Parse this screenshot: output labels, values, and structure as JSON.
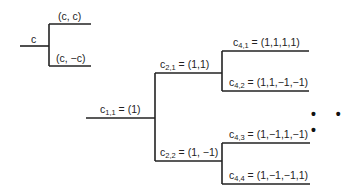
{
  "diagram": {
    "type": "code-tree",
    "left_tree": {
      "root_label": "c",
      "upper_label": "(c, c)",
      "lower_label": "(c, −c)"
    },
    "main_tree": {
      "root": {
        "base": "c",
        "sub": "1,1",
        "value": "= (1)"
      },
      "level2": [
        {
          "base": "c",
          "sub": "2,1",
          "value": "= (1,1)"
        },
        {
          "base": "c",
          "sub": "2,2",
          "value": "= (1, −1)"
        }
      ],
      "level4": [
        {
          "base": "c",
          "sub": "4,1",
          "value": "= (1,1,1,1)"
        },
        {
          "base": "c",
          "sub": "4,2",
          "value": "= (1,1,−1,−1)"
        },
        {
          "base": "c",
          "sub": "4,3",
          "value": "= (1,−1,1,−1)"
        },
        {
          "base": "c",
          "sub": "4,4",
          "value": "= (1,−1,−1,1)"
        }
      ],
      "continuation": "• • •"
    },
    "line_color": "#222222"
  }
}
